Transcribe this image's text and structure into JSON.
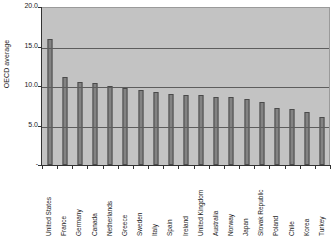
{
  "chart_data": {
    "type": "bar",
    "title": "",
    "xlabel": "",
    "ylabel": "OECD average",
    "ylim": [
      0,
      20
    ],
    "grid": true,
    "legend": "none",
    "orientation": "vertical",
    "y_ticks": [
      {
        "value": 20,
        "label": "20.0"
      },
      {
        "value": 15,
        "label": "15.0"
      },
      {
        "value": 10,
        "label": "10.0"
      },
      {
        "value": 5,
        "label": "5.0"
      },
      {
        "value": 0,
        "label": "-"
      }
    ],
    "categories": [
      "United States",
      "France",
      "Germany",
      "Canada",
      "Netherlands",
      "Greece",
      "Sweden",
      "Italy",
      "Spain",
      "Ireland",
      "United Kingdom",
      "Australia",
      "Norway",
      "Japan",
      "Slovak Republic",
      "Poland",
      "Chile",
      "Korea",
      "Turkey"
    ],
    "values": [
      16.0,
      11.2,
      10.5,
      10.4,
      10.0,
      9.8,
      9.5,
      9.2,
      9.0,
      8.8,
      8.8,
      8.6,
      8.6,
      8.3,
      8.0,
      7.2,
      7.1,
      6.7,
      6.1
    ],
    "series": [
      {
        "name": "OECD average",
        "values": [
          16.0,
          11.2,
          10.5,
          10.4,
          10.0,
          9.8,
          9.5,
          9.2,
          9.0,
          8.8,
          8.8,
          8.6,
          8.6,
          8.3,
          8.0,
          7.2,
          7.1,
          6.7,
          6.1
        ]
      }
    ]
  },
  "colors": {
    "plot_background": "#c3c3c3",
    "bar_fill": "#838383",
    "bar_border": "#4a4a4a",
    "gridline": "#5d5d5d",
    "axis": "#333333",
    "text": "#1a1a1a",
    "page_background": "#ffffff"
  }
}
